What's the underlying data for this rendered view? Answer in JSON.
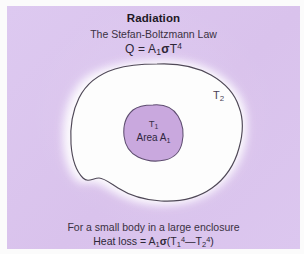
{
  "panel": {
    "background_color": "#dcc6ef",
    "frame_color": "#fbfbfb"
  },
  "header": {
    "title": "Radiation",
    "subtitle": "The Stefan-Boltzmann Law",
    "formula": {
      "lhs": "Q",
      "equals": "=",
      "area_symbol": "A",
      "area_subscript": "1",
      "sigma": "σ",
      "temp_symbol": "T",
      "temp_exponent": "4",
      "plain": "Q = A₁σT⁴"
    }
  },
  "diagram": {
    "type": "enclosure-radiation",
    "enclosure": {
      "name": "large enclosure",
      "fill_color": "#fdfdfd",
      "stroke_color": "#4a4352",
      "halo_color": "#ffffff",
      "label": "T",
      "label_subscript": "2",
      "label_plain": "T₂"
    },
    "body": {
      "name": "small body",
      "fill_color": "#c9a8de",
      "stroke_color": "#5b4a6d",
      "label_temp": "T",
      "label_temp_subscript": "1",
      "label_temp_plain": "T₁",
      "label_area_prefix": "Area A",
      "label_area_subscript": "1",
      "label_area_plain": "Area A₁"
    }
  },
  "caption": {
    "line1": "For a small body in a large enclosure",
    "line2": {
      "prefix": "Heat loss",
      "equals": "=",
      "area_symbol": "A",
      "area_subscript": "1",
      "sigma": "σ",
      "open_paren": "(",
      "t1_symbol": "T",
      "t1_subscript": "1",
      "t1_exponent": "4",
      "minus": "—",
      "t2_symbol": "T",
      "t2_subscript": "2",
      "t2_exponent": "4",
      "close_paren": ")",
      "plain": "Heat loss = A₁σ(T₁⁴ — T₂⁴)"
    }
  }
}
